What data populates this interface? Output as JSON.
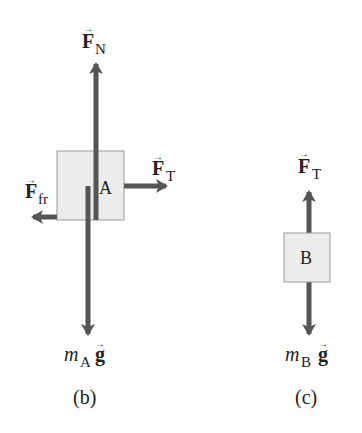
{
  "colors": {
    "arrow": "#555555",
    "box_fill": "#ececec",
    "box_stroke": "#9a9a9a",
    "text": "#222222"
  },
  "panel_b": {
    "caption": "(b)",
    "box_label": "A",
    "forces": {
      "normal": {
        "symbol": "F",
        "subscript": "N",
        "direction": "up"
      },
      "tension": {
        "symbol": "F",
        "subscript": "T",
        "direction": "right"
      },
      "friction": {
        "symbol": "F",
        "subscript": "fr",
        "direction": "left"
      },
      "weight": {
        "mass": "m",
        "mass_subscript": "A",
        "g": "g",
        "direction": "down"
      }
    }
  },
  "panel_c": {
    "caption": "(c)",
    "box_label": "B",
    "forces": {
      "tension": {
        "symbol": "F",
        "subscript": "T",
        "direction": "up"
      },
      "weight": {
        "mass": "m",
        "mass_subscript": "B",
        "g": "g",
        "direction": "down"
      }
    }
  },
  "vector_arrow_glyph": "→"
}
